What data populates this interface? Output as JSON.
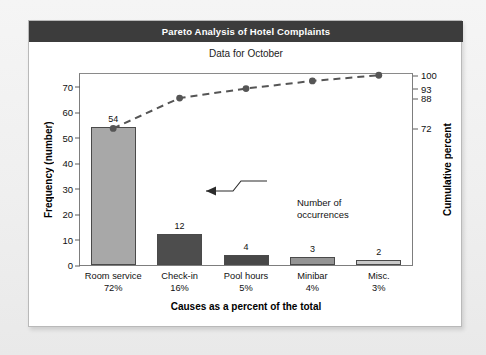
{
  "card": {
    "title": "Pareto Analysis of Hotel Complaints",
    "subtitle": "Data for October"
  },
  "annotation": {
    "line1": "Number of",
    "line2": "occurrences"
  },
  "colors": {
    "title_band": "#3c3c3c",
    "card_background": "#ffffff",
    "page_background": "#f0f0f0",
    "line": "#555555",
    "bar_outline": "#4a4a4a"
  },
  "chart_data": {
    "type": "bar",
    "title": "Pareto Analysis of Hotel Complaints",
    "subtitle": "Data for October",
    "xlabel": "Causes as a percent of the total",
    "ylabel": "Frequency (number)",
    "y2label": "Cumulative percent",
    "categories": [
      "Room service",
      "Check-in",
      "Pool hours",
      "Minibar",
      "Misc."
    ],
    "category_percents": [
      "72%",
      "16%",
      "5%",
      "4%",
      "3%"
    ],
    "values": [
      54,
      12,
      4,
      3,
      2
    ],
    "bar_colors": [
      "#a8a8a8",
      "#4d4d4d",
      "#484848",
      "#949494",
      "#c9c9c9"
    ],
    "ylim": [
      0,
      75
    ],
    "yticks": [
      0,
      10,
      20,
      30,
      40,
      50,
      60,
      70
    ],
    "ytick_labels": [
      "0",
      "10",
      "20",
      "30",
      "40",
      "50",
      "60",
      "70"
    ],
    "y2ticks": [
      72,
      88,
      93,
      100
    ],
    "y2tick_labels": [
      "72",
      "88",
      "93",
      "100"
    ],
    "cumulative_series": {
      "name": "Cumulative percent",
      "values": [
        72,
        88,
        93,
        97,
        100
      ],
      "style": "dashed",
      "marker": "circle"
    },
    "grid": false,
    "legend": "none",
    "annotations": [
      {
        "text": "Number of occurrences",
        "points_to": "12"
      }
    ]
  }
}
